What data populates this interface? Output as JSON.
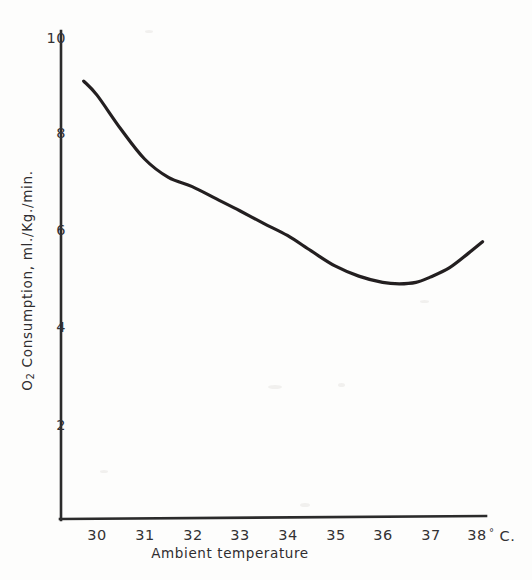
{
  "chart_data": {
    "type": "line",
    "title": "",
    "xlabel": "Ambient temperature",
    "xlabel_units": "° C.",
    "ylabel": "O2 Consumption, ml./Kg./min.",
    "ylabel_prefix": "O",
    "ylabel_subscript": "2",
    "ylabel_rest": " Consumption, ml./Kg./min.",
    "xlim": [
      29.25,
      38.6
    ],
    "ylim": [
      0,
      10.4
    ],
    "xticks": [
      30,
      31,
      32,
      33,
      34,
      35,
      36,
      37,
      38
    ],
    "xtick_labels": [
      "30",
      "31",
      "32",
      "33",
      "34",
      "35",
      "36",
      "37",
      "38"
    ],
    "yticks": [
      2,
      4,
      6,
      8,
      10
    ],
    "ytick_labels": [
      "2",
      "4",
      "6",
      "8",
      "10"
    ],
    "grid": false,
    "legend": false,
    "legend_position": "none",
    "line_color": "#231f20",
    "line_width": 3.2,
    "axis_color": "#2b2b2b",
    "background_color": "#fdfdfc",
    "series": [
      {
        "name": "O2 consumption",
        "x": [
          29.72,
          30.0,
          30.5,
          31.0,
          31.5,
          32.0,
          32.5,
          33.0,
          33.5,
          34.0,
          34.5,
          35.0,
          35.5,
          36.0,
          36.35,
          36.7,
          37.0,
          37.4,
          37.8,
          38.1
        ],
        "y": [
          9.11,
          8.82,
          8.12,
          7.5,
          7.12,
          6.93,
          6.68,
          6.43,
          6.17,
          5.92,
          5.6,
          5.29,
          5.08,
          4.95,
          4.92,
          4.95,
          5.06,
          5.25,
          5.55,
          5.79
        ]
      }
    ],
    "annotations": []
  },
  "figure": {
    "width": 532,
    "height": 580
  }
}
